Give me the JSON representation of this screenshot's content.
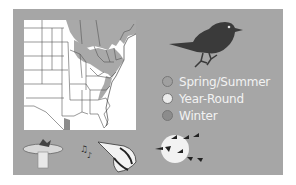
{
  "range_map": {
    "region": "Eastern United States",
    "shaded_regions": [
      "Great Lakes / Northeast (Spring/Summer)",
      "Appalachians",
      "Northern border / Canada (Spring/Summer)"
    ]
  },
  "legend": {
    "items": [
      {
        "label": "Spring/Summer",
        "color": "#a0a0a0"
      },
      {
        "label": "Year-Round",
        "color": "#ececec"
      },
      {
        "label": "Winter",
        "color": "#8c8c8c"
      }
    ]
  },
  "icons": {
    "bird": "bird-silhouette-icon",
    "feeder": "birdbath-icon",
    "song": "woodpecker-singing-icon",
    "migration": "migrating-geese-icon"
  },
  "colors": {
    "panel": "#a6a6a6",
    "map_bg": "#ffffff",
    "map_shade": "#a9a9a9",
    "bird": "#3a3a3a",
    "label_text": "#f2f2f2"
  }
}
